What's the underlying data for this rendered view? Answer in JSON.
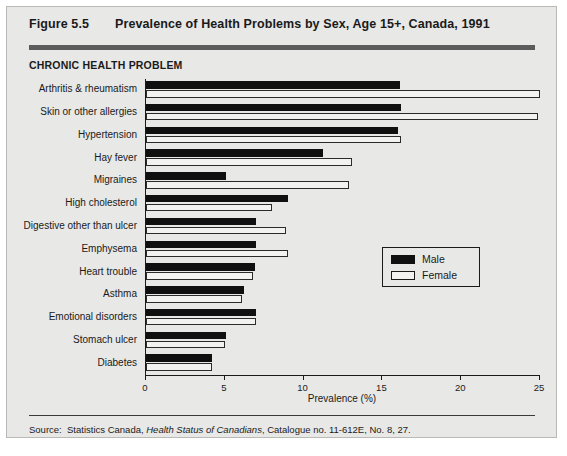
{
  "header": {
    "figure_number": "Figure 5.5",
    "title": "Prevalence of Health Problems by Sex, Age 15+, Canada, 1991"
  },
  "category_axis_heading": "CHRONIC HEALTH PROBLEM",
  "legend": {
    "position": "inside-right-middle",
    "entries": [
      {
        "label": "Male",
        "swatch": "filled-black"
      },
      {
        "label": "Female",
        "swatch": "open-white"
      }
    ]
  },
  "footer": {
    "source_label": "Source:",
    "source_part1": "Statistics Canada,",
    "source_italic": "Health Status of Canadians",
    "source_part2": ", Catalogue no. 11-612E, No. 8, 27."
  },
  "colors": {
    "panel_background": "#e8e8e6",
    "male_bar": "#101010",
    "female_bar_fill": "#f2f2f0",
    "female_bar_stroke": "#2b2b2b",
    "rule": "#5c5c5c",
    "text": "#1a1a1a"
  },
  "chart_data": {
    "type": "bar",
    "orientation": "horizontal",
    "title": "Prevalence of Health Problems by Sex, Age 15+, Canada, 1991",
    "xlabel": "Prevalence (%)",
    "ylabel": "CHRONIC HEALTH PROBLEM",
    "xlim": [
      0,
      25
    ],
    "xticks": [
      0,
      5,
      10,
      15,
      20,
      25
    ],
    "xtick_labels": [
      "0",
      "5",
      "10",
      "15",
      "20",
      "25"
    ],
    "grid": false,
    "legend_position": "inside right",
    "categories": [
      "Arthritis & rheumatism",
      "Skin or other allergies",
      "Hypertension",
      "Hay fever",
      "Migraines",
      "High cholesterol",
      "Digestive other than ulcer",
      "Emphysema",
      "Heart trouble",
      "Asthma",
      "Emotional disorders",
      "Stomach ulcer",
      "Diabetes"
    ],
    "series": [
      {
        "name": "Male",
        "values": [
          16.1,
          16.2,
          16.0,
          11.2,
          5.1,
          9.0,
          7.0,
          7.0,
          6.9,
          6.2,
          7.0,
          5.1,
          4.2
        ]
      },
      {
        "name": "Female",
        "values": [
          25.0,
          24.9,
          16.2,
          13.1,
          12.9,
          8.0,
          8.9,
          9.0,
          6.8,
          6.1,
          7.0,
          5.0,
          4.2
        ]
      }
    ]
  }
}
